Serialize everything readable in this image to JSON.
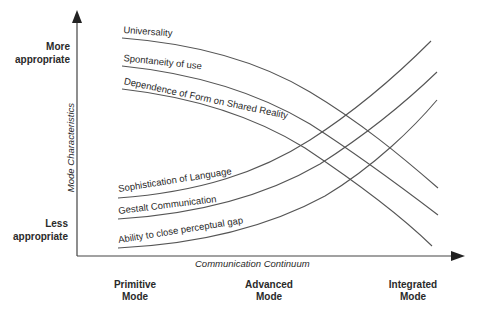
{
  "diagram": {
    "y_axis": {
      "title": "Mode Characteristics",
      "top_label": [
        "More",
        "appropriate"
      ],
      "bottom_label": [
        "Less",
        "appropriate"
      ]
    },
    "x_axis": {
      "title": "Communication Continuum",
      "ticks": [
        {
          "line1": "Primitive",
          "line2": "Mode"
        },
        {
          "line1": "Advanced",
          "line2": "Mode"
        },
        {
          "line1": "Integrated",
          "line2": "Mode"
        }
      ]
    },
    "curves": {
      "decreasing": [
        {
          "label": "Universality"
        },
        {
          "label": "Spontaneity of use"
        },
        {
          "label": "Dependence of Form on Shared Reality"
        }
      ],
      "increasing": [
        {
          "label": "Sophistication of Language"
        },
        {
          "label": "Gestalt Communication"
        },
        {
          "label": "Ability to close perceptual gap"
        }
      ]
    },
    "colors": {
      "line": "#4a4a4a",
      "axis": "#333333"
    }
  }
}
